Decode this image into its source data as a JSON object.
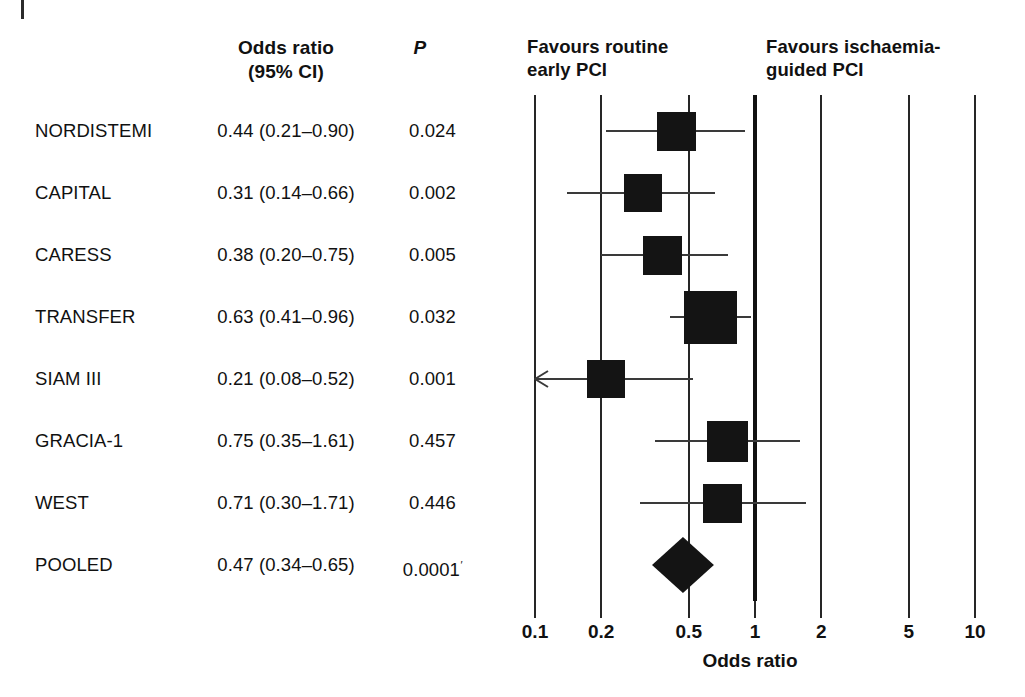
{
  "table": {
    "headers": {
      "study": "",
      "odds_ratio_line1": "Odds ratio",
      "odds_ratio_line2": "(95% CI)",
      "p": "P"
    },
    "rows": [
      {
        "study": "NORDISTEMI",
        "or_ci": "0.44 (0.21–0.90)",
        "p": "0.024"
      },
      {
        "study": "CAPITAL",
        "or_ci": "0.31 (0.14–0.66)",
        "p": "0.002"
      },
      {
        "study": "CARESS",
        "or_ci": "0.38 (0.20–0.75)",
        "p": "0.005"
      },
      {
        "study": "TRANSFER",
        "or_ci": "0.63 (0.41–0.96)",
        "p": "0.032"
      },
      {
        "study": "SIAM III",
        "or_ci": "0.21 (0.08–0.52)",
        "p": "0.001"
      },
      {
        "study": "GRACIA-1",
        "or_ci": "0.75 (0.35–1.61)",
        "p": "0.457"
      },
      {
        "study": "WEST",
        "or_ci": "0.71 (0.30–1.71)",
        "p": "0.446"
      },
      {
        "study": "POOLED",
        "or_ci": "0.47 (0.34–0.65)",
        "p": "0.0001",
        "p_sup": "′"
      }
    ]
  },
  "plot_headers": {
    "left_line1": "Favours routine",
    "left_line2": "early PCI",
    "right_line1": "Favours ischaemia-",
    "right_line2": "guided PCI"
  },
  "chart_data": {
    "type": "forest",
    "title": "",
    "xlabel": "Odds ratio",
    "ylabel": "",
    "xscale": "log",
    "xlim": [
      0.1,
      10
    ],
    "ticks": [
      "0.1",
      "0.2",
      "0.5",
      "1",
      "2",
      "5",
      "10"
    ],
    "tick_values": [
      0.1,
      0.2,
      0.5,
      1,
      2,
      5,
      10
    ],
    "null_value": 1,
    "grid": true,
    "legend": "none",
    "favours_left": "Favours routine early PCI",
    "favours_right": "Favours ischaemia-guided PCI",
    "measure": "Odds ratio (95% CI)",
    "studies": [
      {
        "name": "NORDISTEMI",
        "estimate": 0.44,
        "ci_low": 0.21,
        "ci_high": 0.9,
        "p": 0.024,
        "weight_rel": 0.62,
        "arrow_left": false
      },
      {
        "name": "CAPITAL",
        "estimate": 0.31,
        "ci_low": 0.14,
        "ci_high": 0.66,
        "p": 0.002,
        "weight_rel": 0.6,
        "arrow_left": false
      },
      {
        "name": "CARESS",
        "estimate": 0.38,
        "ci_low": 0.2,
        "ci_high": 0.75,
        "p": 0.005,
        "weight_rel": 0.62,
        "arrow_left": false
      },
      {
        "name": "TRANSFER",
        "estimate": 0.63,
        "ci_low": 0.41,
        "ci_high": 0.96,
        "p": 0.032,
        "weight_rel": 1.0,
        "arrow_left": false
      },
      {
        "name": "SIAM III",
        "estimate": 0.21,
        "ci_low": 0.08,
        "ci_high": 0.52,
        "p": 0.001,
        "weight_rel": 0.6,
        "arrow_left": true
      },
      {
        "name": "GRACIA-1",
        "estimate": 0.75,
        "ci_low": 0.35,
        "ci_high": 1.61,
        "p": 0.457,
        "weight_rel": 0.68,
        "arrow_left": false
      },
      {
        "name": "WEST",
        "estimate": 0.71,
        "ci_low": 0.3,
        "ci_high": 1.71,
        "p": 0.446,
        "weight_rel": 0.62,
        "arrow_left": false
      }
    ],
    "pooled": {
      "name": "POOLED",
      "estimate": 0.47,
      "ci_low": 0.34,
      "ci_high": 0.65,
      "p": 0.0001,
      "shape": "diamond"
    }
  },
  "colors": {
    "marker": "#141414",
    "gridline": "#262626",
    "ci_line": "#3a3a3a",
    "text": "#111111",
    "background": "#ffffff"
  }
}
